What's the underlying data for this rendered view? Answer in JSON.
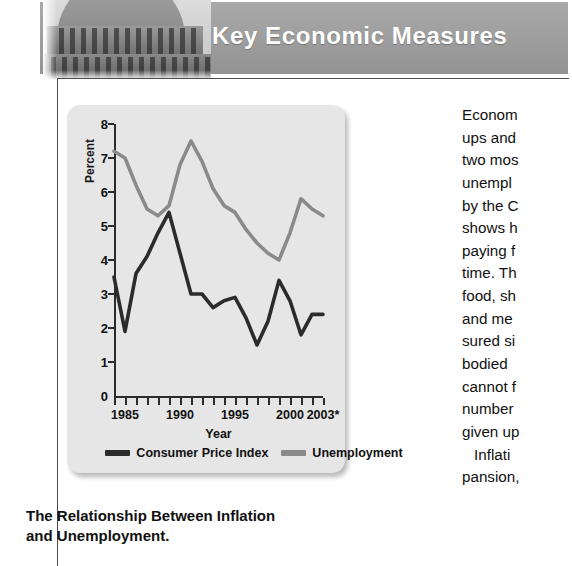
{
  "header": {
    "title": "Key Economic Measures",
    "photo_alt": "us-capitol-dome"
  },
  "caption": {
    "line1": "The Relationship Between Inflation",
    "line2": "and Unemployment."
  },
  "legend": [
    {
      "label": "Consumer Price Index",
      "color": "#2b2b2b"
    },
    {
      "label": "Unemployment",
      "color": "#8a8a8a"
    }
  ],
  "body_text": {
    "paragraphs": [
      "Econom",
      "ups and",
      "two mos",
      "unempl",
      "by the C",
      "shows h",
      "paying f",
      "time. Th",
      "food, sh",
      "and me",
      "sured si",
      "bodied",
      "cannot f",
      "number",
      "given up",
      "  Inflati",
      "pansion,"
    ]
  },
  "chart_data": {
    "type": "line",
    "title": "",
    "xlabel": "Year",
    "ylabel": "Percent",
    "ylim": [
      0,
      8
    ],
    "xlim": [
      1984,
      2003
    ],
    "yticks": [
      0,
      1,
      2,
      3,
      4,
      5,
      6,
      7,
      8
    ],
    "xticks": [
      1984,
      1985,
      1986,
      1987,
      1988,
      1989,
      1990,
      1991,
      1992,
      1993,
      1994,
      1995,
      1996,
      1997,
      1998,
      1999,
      2000,
      2001,
      2002,
      2003
    ],
    "xtick_labels": [
      "1985",
      "1990",
      "1995",
      "2000",
      "2003*"
    ],
    "xtick_label_years": [
      1985,
      1990,
      1995,
      2000,
      2003
    ],
    "grid": false,
    "legend_position": "bottom",
    "x": [
      1984,
      1985,
      1986,
      1987,
      1988,
      1989,
      1990,
      1991,
      1992,
      1993,
      1994,
      1995,
      1996,
      1997,
      1998,
      1999,
      2000,
      2001,
      2002,
      2003
    ],
    "series": [
      {
        "name": "Consumer Price Index",
        "color": "#2b2b2b",
        "values": [
          3.5,
          1.9,
          3.6,
          4.1,
          4.8,
          5.4,
          4.2,
          3.0,
          3.0,
          2.6,
          2.8,
          2.9,
          2.3,
          1.5,
          2.2,
          3.4,
          2.8,
          1.8,
          2.4,
          2.4
        ]
      },
      {
        "name": "Unemployment",
        "color": "#8a8a8a",
        "values": [
          7.2,
          7.0,
          6.2,
          5.5,
          5.3,
          5.6,
          6.8,
          7.5,
          6.9,
          6.1,
          5.6,
          5.4,
          4.9,
          4.5,
          4.2,
          4.0,
          4.8,
          5.8,
          5.5,
          5.3
        ]
      }
    ]
  }
}
